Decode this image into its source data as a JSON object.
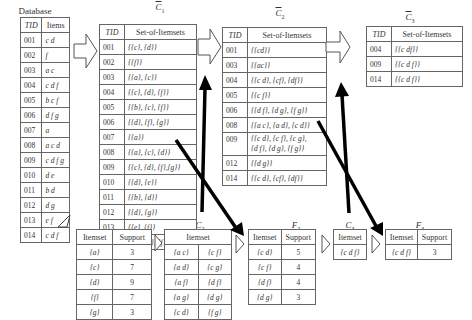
{
  "database": {
    "title": "Database",
    "headers": [
      "TID",
      "Items"
    ],
    "rows": [
      [
        "001",
        "c d"
      ],
      [
        "002",
        "f"
      ],
      [
        "003",
        "a c"
      ],
      [
        "004",
        "c d f"
      ],
      [
        "005",
        "b c f"
      ],
      [
        "006",
        "d f g"
      ],
      [
        "007",
        "a"
      ],
      [
        "008",
        "a c d"
      ],
      [
        "009",
        "c d f g"
      ],
      [
        "010",
        "d e"
      ],
      [
        "011",
        "b d"
      ],
      [
        "012",
        "d g"
      ],
      [
        "013",
        "e f"
      ],
      [
        "014",
        "c d f"
      ]
    ]
  },
  "cbar1": {
    "title": "C",
    "subscript": "1",
    "headers": [
      "TID",
      "Set-of-Itemsets"
    ],
    "rows": [
      [
        "001",
        "{{c}, {d}}"
      ],
      [
        "002",
        "{{f}}"
      ],
      [
        "003",
        "{{a}, {c}}"
      ],
      [
        "004",
        "{{c}, {d}, {f}}"
      ],
      [
        "005",
        "{{b}, {c}, {f}}"
      ],
      [
        "006",
        "{{d}, {f}, {g}}"
      ],
      [
        "007",
        "{{a}}"
      ],
      [
        "008",
        "{{a}, {c}, {d}}"
      ],
      [
        "009",
        "{{c}, {d}, {f},{g}}"
      ],
      [
        "010",
        "{{d}, {e}}"
      ],
      [
        "011",
        "{{b}, {d}}"
      ],
      [
        "012",
        "{{d}, {g}}"
      ],
      [
        "013",
        "{{e}, {f}}"
      ],
      [
        "014",
        "{{c}, {d}, {f}}"
      ]
    ]
  },
  "cbar2": {
    "title": "C",
    "subscript": "2",
    "headers": [
      "TID",
      "Set-of-Itemsets"
    ],
    "rows": [
      [
        "001",
        "{{cd}}"
      ],
      [
        "003",
        "{{ac}}"
      ],
      [
        "004",
        "{{c d}, {cf}, {df}}"
      ],
      [
        "005",
        "{{c f}}"
      ],
      [
        "006",
        "{{d f}, {d g}, {f g}}"
      ],
      [
        "008",
        "{{a c}, {a d}, {c d}}"
      ],
      [
        "009",
        "{{c d}, {c f}, {c g},",
        "{d f}, {d g}, {f g}}"
      ],
      [
        "012",
        "{{d g}}"
      ],
      [
        "014",
        "{{c d}, {cf}, {df}}"
      ]
    ]
  },
  "cbar3": {
    "title": "C",
    "subscript": "3",
    "headers": [
      "TID",
      "Set-of-Itemsets"
    ],
    "rows": [
      [
        "004",
        "{{c df}}"
      ],
      [
        "009",
        "{{c d f}}"
      ],
      [
        "014",
        "{{c d f}}"
      ]
    ]
  },
  "f1": {
    "title": "F",
    "subscript": "1",
    "headers": [
      "Itemset",
      "Support"
    ],
    "rows": [
      [
        "{a}",
        "3"
      ],
      [
        "{c}",
        "7"
      ],
      [
        "{d}",
        "9"
      ],
      [
        "{f}",
        "7"
      ],
      [
        "{g}",
        "3"
      ]
    ]
  },
  "c2": {
    "title": "C",
    "subscript": "2",
    "header": "Itemset",
    "rows": [
      [
        "{a c}",
        "{c f}"
      ],
      [
        "{a d}",
        "{c g}"
      ],
      [
        "{a f}",
        "{d f}"
      ],
      [
        "{a g}",
        "{d g}"
      ],
      [
        "{c d}",
        "{f g}"
      ]
    ]
  },
  "f2": {
    "title": "F",
    "subscript": "2",
    "headers": [
      "Itemset",
      "Support"
    ],
    "rows": [
      [
        "{c d}",
        "5"
      ],
      [
        "{c f}",
        "4"
      ],
      [
        "{d f}",
        "4"
      ],
      [
        "{d g}",
        "3"
      ]
    ]
  },
  "c3": {
    "title": "C",
    "subscript": "3",
    "header": "Itemset",
    "rows": [
      [
        "{c d f}"
      ]
    ]
  },
  "f3": {
    "title": "F",
    "subscript": "3",
    "headers": [
      "Itemset",
      "Support"
    ],
    "rows": [
      [
        "{c d f}",
        "3"
      ]
    ]
  }
}
